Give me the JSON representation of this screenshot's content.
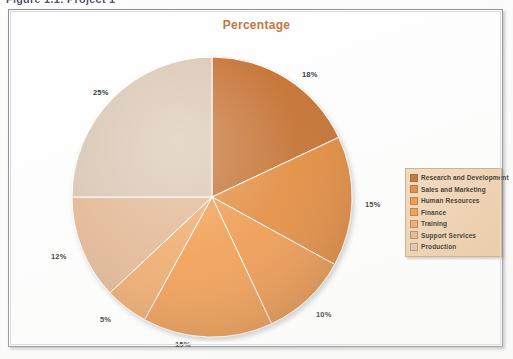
{
  "caption": "Figure 1.1: Project 1",
  "chart": {
    "title": "Percentage"
  },
  "legend": {
    "items": [
      {
        "label": "Research and Development",
        "color": "#c0631d"
      },
      {
        "label": "Sales and Marketing",
        "color": "#e2802b"
      },
      {
        "label": "Human Resources",
        "color": "#ef8f3c"
      },
      {
        "label": "Finance",
        "color": "#f2943f"
      },
      {
        "label": "Training",
        "color": "#f0a460"
      },
      {
        "label": "Support Services",
        "color": "#e2b38c"
      },
      {
        "label": "Production",
        "color": "#d8c3af"
      }
    ]
  },
  "labels": {
    "l0": "18%",
    "l1": "15%",
    "l2": "10%",
    "l3": "15%",
    "l4": "5%",
    "l5": "12%",
    "l6": "25%"
  },
  "chart_data": {
    "type": "pie",
    "title": "Percentage",
    "xlabel": "",
    "ylabel": "",
    "categories": [
      "Research and Development",
      "Sales and Marketing",
      "Human Resources",
      "Finance",
      "Training",
      "Support Services",
      "Production"
    ],
    "values": [
      18,
      15,
      10,
      15,
      5,
      12,
      25
    ],
    "value_labels": [
      "18%",
      "15%",
      "10%",
      "15%",
      "5%",
      "12%",
      "25%"
    ],
    "colors": [
      "#c0631d",
      "#e2802b",
      "#ef8f3c",
      "#f2943f",
      "#f0a460",
      "#e2b38c",
      "#d8c3af"
    ],
    "units": "percent",
    "total": 100,
    "start_angle_deg": 0,
    "direction": "clockwise",
    "legend": true,
    "legend_position": "right",
    "grid": false,
    "data_labels_outside": true
  }
}
